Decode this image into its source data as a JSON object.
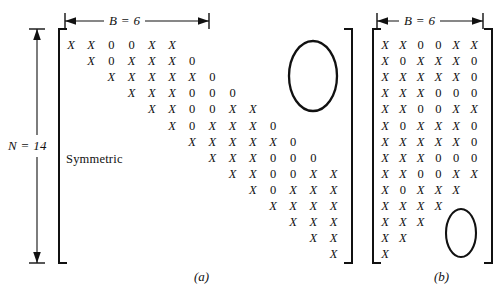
{
  "figure": {
    "panel_a": {
      "caption": "(a)",
      "band_label": "B = 6",
      "size_label": "N = 14",
      "symmetric_note": "Symmetric",
      "description": "Upper triangular band of a symmetric matrix, N = 14, bandwidth B = 6",
      "rows": [
        {
          "offset": 0,
          "cells": [
            "X",
            "X",
            "0",
            "0",
            "X",
            "X"
          ]
        },
        {
          "offset": 1,
          "cells": [
            "X",
            "0",
            "X",
            "X",
            "X",
            "0"
          ]
        },
        {
          "offset": 2,
          "cells": [
            "X",
            "X",
            "X",
            "X",
            "X",
            "0"
          ]
        },
        {
          "offset": 3,
          "cells": [
            "X",
            "X",
            "X",
            "0",
            "0",
            "0"
          ]
        },
        {
          "offset": 4,
          "cells": [
            "X",
            "X",
            "0",
            "0",
            "X",
            "X"
          ]
        },
        {
          "offset": 5,
          "cells": [
            "X",
            "0",
            "X",
            "X",
            "X",
            "0"
          ]
        },
        {
          "offset": 6,
          "cells": [
            "X",
            "X",
            "X",
            "X",
            "X",
            "0"
          ]
        },
        {
          "offset": 7,
          "cells": [
            "X",
            "X",
            "X",
            "0",
            "0",
            "0"
          ]
        },
        {
          "offset": 8,
          "cells": [
            "X",
            "X",
            "0",
            "0",
            "X",
            "X"
          ]
        },
        {
          "offset": 9,
          "cells": [
            "X",
            "0",
            "X",
            "X",
            "X"
          ]
        },
        {
          "offset": 10,
          "cells": [
            "X",
            "X",
            "X",
            "X"
          ]
        },
        {
          "offset": 11,
          "cells": [
            "X",
            "X",
            "X"
          ]
        },
        {
          "offset": 12,
          "cells": [
            "X",
            "X"
          ]
        },
        {
          "offset": 13,
          "cells": [
            "X"
          ]
        }
      ]
    },
    "panel_b": {
      "caption": "(b)",
      "band_label": "B = 6",
      "description": "The same band stored as a compact N by B rectangular array",
      "rows": [
        {
          "offset": 0,
          "cells": [
            "X",
            "X",
            "0",
            "0",
            "X",
            "X"
          ]
        },
        {
          "offset": 0,
          "cells": [
            "X",
            "0",
            "X",
            "X",
            "X",
            "0"
          ]
        },
        {
          "offset": 0,
          "cells": [
            "X",
            "X",
            "X",
            "X",
            "X",
            "0"
          ]
        },
        {
          "offset": 0,
          "cells": [
            "X",
            "X",
            "X",
            "0",
            "0",
            "0"
          ]
        },
        {
          "offset": 0,
          "cells": [
            "X",
            "X",
            "0",
            "0",
            "X",
            "X"
          ]
        },
        {
          "offset": 0,
          "cells": [
            "X",
            "0",
            "X",
            "X",
            "X",
            "0"
          ]
        },
        {
          "offset": 0,
          "cells": [
            "X",
            "X",
            "X",
            "X",
            "X",
            "0"
          ]
        },
        {
          "offset": 0,
          "cells": [
            "X",
            "X",
            "X",
            "0",
            "0",
            "0"
          ]
        },
        {
          "offset": 0,
          "cells": [
            "X",
            "X",
            "0",
            "0",
            "X",
            "X"
          ]
        },
        {
          "offset": 0,
          "cells": [
            "X",
            "0",
            "X",
            "X",
            "X"
          ]
        },
        {
          "offset": 0,
          "cells": [
            "X",
            "X",
            "X",
            "X"
          ]
        },
        {
          "offset": 0,
          "cells": [
            "X",
            "X",
            "X"
          ]
        },
        {
          "offset": 0,
          "cells": [
            "X",
            "X"
          ]
        },
        {
          "offset": 0,
          "cells": [
            "X"
          ]
        }
      ]
    }
  }
}
